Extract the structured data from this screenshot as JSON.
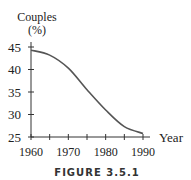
{
  "chart_data": {
    "type": "line",
    "title": "",
    "caption": "FIGURE 3.5.1",
    "ylabel_line1": "Couples",
    "ylabel_line2": "(%)",
    "xlabel": "Year",
    "x": [
      1960,
      1965,
      1970,
      1975,
      1980,
      1985,
      1990
    ],
    "series": [
      {
        "name": "Couples (%)",
        "values": [
          44.3,
          43.2,
          40.3,
          35.5,
          31.0,
          27.3,
          25.8
        ]
      }
    ],
    "xlim": [
      1960,
      1990
    ],
    "ylim": [
      25,
      45
    ],
    "xticks": [
      1960,
      1965,
      1970,
      1975,
      1980,
      1985,
      1990
    ],
    "xtick_labels": [
      "1960",
      "1970",
      "1980",
      "1990"
    ],
    "yticks": [
      25,
      30,
      35,
      40,
      45
    ],
    "ytick_labels": [
      "25",
      "30",
      "35",
      "40",
      "45"
    ],
    "grid": false,
    "legend": "none",
    "line_color": "#555555"
  }
}
